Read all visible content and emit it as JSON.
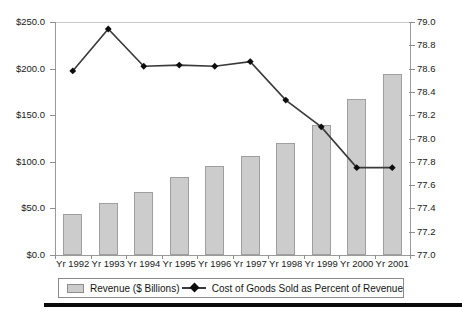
{
  "chart_data": {
    "type": "bar",
    "title": "",
    "subtitle": "",
    "xlabel": "",
    "ylabel": "",
    "grid": false,
    "legend_position": "bottom",
    "categories": [
      "Yr 1992",
      "Yr 1993",
      "Yr 1994",
      "Yr 1995",
      "Yr 1996",
      "Yr 1997",
      "Yr 1998",
      "Yr 1999",
      "Yr 2000",
      "Yr 2001"
    ],
    "series": [
      {
        "name": "Revenue ($ Billions)",
        "type": "bar",
        "axis": "left",
        "color": "#cccccc",
        "border_color": "#9f9f9f",
        "values": [
          44,
          56,
          68,
          84,
          95,
          106,
          120,
          139,
          167,
          194
        ]
      },
      {
        "name": "Cost of Goods Sold as Percent of Revenue",
        "type": "line",
        "axis": "right",
        "color": "#3a3a3a",
        "marker_color": "#0d0d0d",
        "values": [
          78.58,
          78.94,
          78.62,
          78.63,
          78.62,
          78.66,
          78.33,
          78.1,
          77.75,
          77.75
        ]
      }
    ],
    "left_axis": {
      "min": 0,
      "max": 250,
      "step": 50,
      "ticks": [
        0,
        50,
        100,
        150,
        200,
        250
      ],
      "tick_labels": [
        "$0.0",
        "$50.0",
        "$100.0",
        "$150.0",
        "$200.0",
        "$250.0"
      ]
    },
    "right_axis": {
      "min": 77.0,
      "max": 79.0,
      "step": 0.2,
      "ticks": [
        77.0,
        77.2,
        77.4,
        77.6,
        77.8,
        78.0,
        78.2,
        78.4,
        78.6,
        78.8,
        79.0
      ],
      "tick_labels": [
        "77.0",
        "77.2",
        "77.4",
        "77.6",
        "77.8",
        "78.0",
        "78.2",
        "78.4",
        "78.6",
        "78.8",
        "79.0"
      ]
    }
  },
  "legend": {
    "bar_label": "Revenue ($ Billions)",
    "line_label": "Cost of Goods Sold as Percent of Revenue"
  }
}
